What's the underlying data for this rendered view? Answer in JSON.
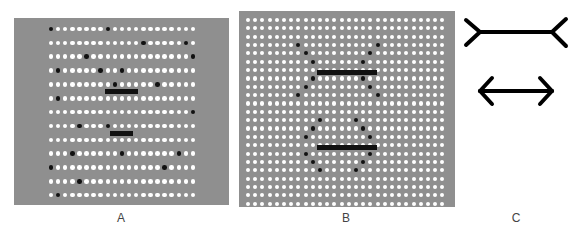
{
  "panels": {
    "a": {
      "label": "A",
      "grid": {
        "cols": 21,
        "rows": 13,
        "x0": 37,
        "y0": 11,
        "dx": 7.1,
        "dy": 13.85,
        "r": 2.3
      },
      "black_dots": [
        [
          0,
          0
        ],
        [
          8,
          0
        ],
        [
          13,
          1
        ],
        [
          19,
          1
        ],
        [
          5,
          2
        ],
        [
          20,
          2
        ],
        [
          1,
          3
        ],
        [
          7,
          3
        ],
        [
          10,
          3
        ],
        [
          9,
          4
        ],
        [
          15,
          4
        ],
        [
          1,
          5
        ],
        [
          20,
          6
        ],
        [
          4,
          7
        ],
        [
          8,
          7
        ],
        [
          3,
          9
        ],
        [
          10,
          9
        ],
        [
          18,
          9
        ],
        [
          0,
          10
        ],
        [
          16,
          10
        ],
        [
          4,
          11
        ],
        [
          1,
          12
        ]
      ],
      "bars": [
        {
          "x": 91,
          "y": 71,
          "w": 33,
          "h": 5
        },
        {
          "x": 96,
          "y": 113,
          "w": 23,
          "h": 5
        }
      ]
    },
    "b": {
      "label": "B",
      "grid": {
        "cols": 28,
        "rows": 23,
        "x0": 9,
        "y0": 9,
        "dx": 7.2,
        "dy": 8.35,
        "r": 2.1
      },
      "black_dots": [
        [
          7,
          3
        ],
        [
          18,
          3
        ],
        [
          8,
          4
        ],
        [
          17,
          4
        ],
        [
          9,
          5
        ],
        [
          16,
          5
        ],
        [
          9,
          7
        ],
        [
          16,
          7
        ],
        [
          8,
          8
        ],
        [
          17,
          8
        ],
        [
          7,
          9
        ],
        [
          18,
          9
        ],
        [
          10,
          12
        ],
        [
          15,
          12
        ],
        [
          9,
          13
        ],
        [
          16,
          13
        ],
        [
          8,
          14
        ],
        [
          17,
          14
        ],
        [
          8,
          16
        ],
        [
          17,
          16
        ],
        [
          9,
          17
        ],
        [
          16,
          17
        ],
        [
          10,
          18
        ],
        [
          15,
          18
        ]
      ],
      "bars": [
        {
          "x": 78,
          "y": 59,
          "w": 60,
          "h": 5
        },
        {
          "x": 78,
          "y": 134,
          "w": 60,
          "h": 5
        }
      ]
    },
    "c": {
      "label": "C",
      "figures": [
        "fins-out",
        "arrowheads-in"
      ]
    }
  },
  "labels": {
    "a": "A",
    "b": "B",
    "c": "C"
  }
}
